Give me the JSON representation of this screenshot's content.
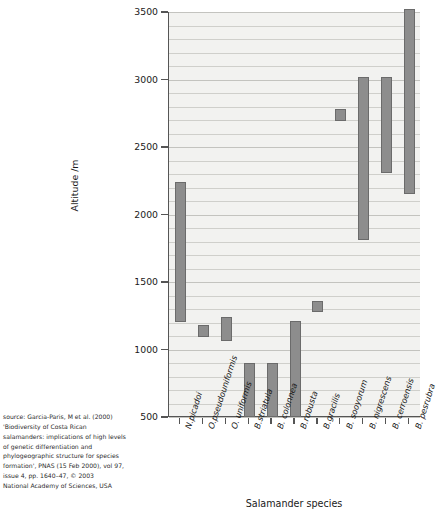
{
  "chart_data": {
    "type": "bar",
    "title": "",
    "subtitle": "",
    "xlabel": "Salamander species",
    "ylabel": "Altitude /m",
    "ylim": [
      500,
      3500
    ],
    "yticks": [
      500,
      1000,
      1500,
      2000,
      2500,
      3000,
      3500
    ],
    "ytick_labels": [
      "500",
      "1000",
      "1500",
      "2000",
      "2500",
      "3000",
      "3500"
    ],
    "grid": true,
    "legend": "none",
    "bar_orientation": "vertical",
    "value_kind": "altitude-range",
    "categories": [
      "N.picadoi",
      "O.pseudouniformis",
      "O. uniformis",
      "B.striatula",
      "B. colonnea",
      "B.robusta",
      "B.gracilis",
      "B. sooyorum",
      "B. nigrescens",
      "B. cerroensis",
      "B. pesrubra"
    ],
    "series": [
      {
        "name": "Altitude range",
        "low": [
          1200,
          1090,
          1060,
          500,
          500,
          500,
          1280,
          2690,
          1810,
          2310,
          2150
        ],
        "high": [
          2240,
          1180,
          1240,
          900,
          900,
          1210,
          1360,
          2780,
          3020,
          3020,
          3520
        ]
      }
    ],
    "colors": {
      "bar_fill": "#8d8d8d",
      "bar_edge": "#6b6b6b",
      "plot_background": "#f2f2f0",
      "gridline": "#cfcfcb",
      "axis": "#555555",
      "text": "#1a1a1a"
    }
  },
  "caption": {
    "lines": [
      "source: Garcia-Paris, M et al. (2000)",
      "'Biodiversity of Costa Rican",
      "salamanders: implications of high levels",
      "of genetic differentiation and",
      "phylogeographic structure for species",
      "formation', PNAS (15 Feb 2000), vol 97,",
      "issue 4, pp. 1640–47, © 2003",
      "National Academy of Sciences, USA"
    ]
  }
}
